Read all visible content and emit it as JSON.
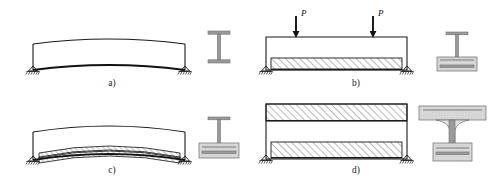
{
  "figure": {
    "type": "engineering-diagram",
    "width": 488,
    "height": 180,
    "background_color": "#ffffff",
    "line_color": "#1a1a1a",
    "hatch_color": "#2b2b2b",
    "section_fill_color": "#d8d8d8",
    "flange_fill_color": "#9a9a9a"
  },
  "panels": [
    {
      "id": "a",
      "label": "a)",
      "label_x": 112,
      "label_y": 86,
      "description": "cambered steel girder on simple supports, no slab",
      "elevation": {
        "left_support_x": 33,
        "right_support_x": 185,
        "base_y": 70,
        "top_chord_rise": 10,
        "bottom_chord_rise": 8,
        "depth": 26
      },
      "cross_section": {
        "kind": "steel-i-beam",
        "center_x": 219,
        "top_y": 31,
        "bottom_y": 63,
        "flange_width": 22,
        "web_width": 3
      },
      "loads": []
    },
    {
      "id": "b",
      "label": "b)",
      "label_x": 356,
      "label_y": 86,
      "description": "straight steel girder shored, concrete slab cast on bottom, two point loads P applied",
      "elevation": {
        "left_support_x": 266,
        "right_support_x": 407,
        "base_y": 70,
        "girder_top_y": 37,
        "slab_top_y": 58,
        "slab_bottom_y": 70
      },
      "cross_section": {
        "kind": "steel-i-beam-in-concrete-block",
        "center_x": 457,
        "block_left": 437,
        "block_right": 477,
        "block_top": 57,
        "block_bottom": 71
      },
      "loads": [
        {
          "label": "P",
          "x": 296,
          "tip_y": 37,
          "tail_y": 16,
          "label_x": 301,
          "label_y": 15
        },
        {
          "label": "P",
          "x": 373,
          "tip_y": 37,
          "tail_y": 16,
          "label_x": 378,
          "label_y": 15
        }
      ]
    },
    {
      "id": "c",
      "label": "c)",
      "label_x": 112,
      "label_y": 173,
      "description": "cambered girder with cast curved concrete slab bonded to bottom flange",
      "elevation": {
        "left_support_x": 33,
        "right_support_x": 185,
        "base_y": 160,
        "top_chord_rise": 12,
        "slab_rise": 12,
        "depth": 28
      },
      "cross_section": {
        "kind": "steel-i-beam-in-concrete-block",
        "center_x": 219,
        "block_left": 199,
        "block_right": 239,
        "block_top": 146,
        "block_bottom": 160
      },
      "loads": []
    },
    {
      "id": "d",
      "label": "d)",
      "label_x": 356,
      "label_y": 173,
      "description": "completed composite girder with top deck slab and bottom encasement slab",
      "elevation": {
        "left_support_x": 266,
        "right_support_x": 407,
        "base_y": 160,
        "top_slab_top_y": 104,
        "top_slab_bottom_y": 121,
        "bottom_slab_top_y": 142,
        "bottom_slab_bottom_y": 159
      },
      "cross_section": {
        "kind": "composite-i-girder-with-deck-and-encasement",
        "center_x": 452,
        "deck_left": 419,
        "deck_right": 486,
        "deck_top": 106,
        "deck_bottom": 120,
        "bottom_left": 433,
        "bottom_right": 472,
        "bottom_top": 143,
        "bottom_bottom": 161
      },
      "loads": []
    }
  ],
  "annotations": {
    "support_symbol": "pinned-support-with-ground-hatch",
    "hatch_pattern": "diagonal-45-degree-lines",
    "load_symbol": "downward-arrow"
  }
}
